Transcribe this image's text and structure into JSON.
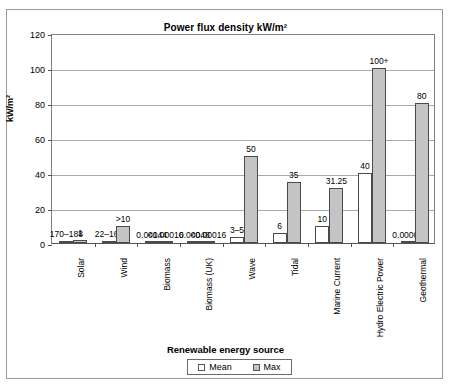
{
  "chart_data": {
    "type": "bar",
    "title": "Power flux density kW/m²",
    "xlabel": "Renewable energy source",
    "ylabel": "kW/m²",
    "ylim": [
      0,
      120
    ],
    "yticks": [
      0,
      20,
      40,
      60,
      80,
      100,
      120
    ],
    "grid": true,
    "legend_position": "bottom",
    "categories": [
      "Solar",
      "Wind",
      "Biomass",
      "Biomass (UK)",
      "Wave",
      "Tidal",
      "Marine Current",
      "Hydro Electric Power",
      "Geothermal"
    ],
    "series": [
      {
        "name": "Mean",
        "color": "#ffffff",
        "values": [
          1.2,
          0.9,
          0.00144,
          0.00048,
          3.5,
          6,
          10,
          40,
          6e-05
        ],
        "labels": [
          "170–188",
          "22–168",
          "0.00144",
          "0.00048",
          "3–5",
          "6",
          "10",
          "40",
          "0.00006"
        ]
      },
      {
        "name": "Max",
        "color": "#c4c4c4",
        "values": [
          1.8,
          10,
          0.00016,
          0.00016,
          50,
          35,
          31.25,
          100,
          80
        ],
        "labels": [
          "1",
          ">10",
          "<0.00016",
          "<0.00016",
          "50",
          "35",
          "31.25",
          "100+",
          "80"
        ]
      }
    ]
  },
  "legend": {
    "mean_label": "Mean",
    "max_label": "Max"
  }
}
